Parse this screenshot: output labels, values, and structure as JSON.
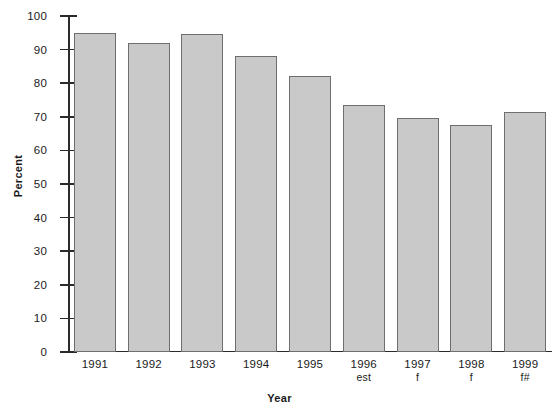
{
  "chart_data": {
    "type": "bar",
    "title": "",
    "xlabel": "Year",
    "ylabel": "Percent",
    "ylim": [
      0,
      100
    ],
    "ytick_step": 10,
    "grid": false,
    "legend": null,
    "bar_color": "#c9c9c9",
    "bar_border_color": "#6e6e6e",
    "axis_color": "#2b2b2b",
    "categories": [
      "1991",
      "1992",
      "1993",
      "1994",
      "1995",
      "1996",
      "1997",
      "1998",
      "1999"
    ],
    "category_notes": [
      "",
      "",
      "",
      "",
      "",
      "est",
      "f",
      "f",
      "f#"
    ],
    "values": [
      95,
      92,
      94.5,
      88,
      82,
      73.5,
      69.5,
      67.5,
      71.5
    ],
    "yticks": [
      "0",
      "10",
      "20",
      "30",
      "40",
      "50",
      "60",
      "70",
      "80",
      "90",
      "100"
    ],
    "ytick_values": [
      0,
      10,
      20,
      30,
      40,
      50,
      60,
      70,
      80,
      90,
      100
    ]
  }
}
